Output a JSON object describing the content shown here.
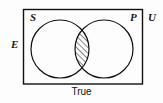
{
  "diagram": {
    "type": "venn-diagram",
    "caption": "True",
    "universe": {
      "label": "U",
      "shape": "rectangle"
    },
    "outside_label": {
      "label": "E"
    },
    "sets": [
      {
        "id": "S",
        "label": "S",
        "shape": "circle",
        "position": "left"
      },
      {
        "id": "P",
        "label": "P",
        "shape": "circle",
        "position": "right"
      }
    ],
    "shaded_region": {
      "name": "S-intersect-P",
      "fill": "diagonal-hatch",
      "hatch_direction": "forward-slash"
    },
    "colors": {
      "stroke": "#111111",
      "background": "#fdfdfd",
      "hatch": "#222222",
      "text": "#1a1a1a"
    }
  }
}
